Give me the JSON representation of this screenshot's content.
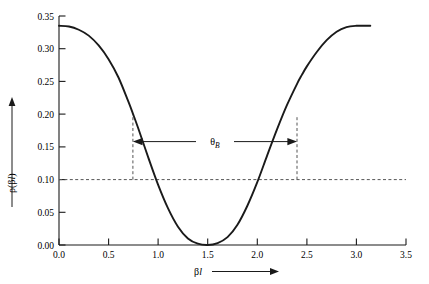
{
  "chart_data": {
    "type": "line",
    "title": "",
    "xlabel": "βl",
    "ylabel": "ρ(βl)",
    "xlim": [
      0.0,
      3.5
    ],
    "ylim": [
      0.0,
      0.35
    ],
    "grid": false,
    "legend": "none",
    "x_ticks": [
      "0.0",
      "0.5",
      "1.0",
      "1.5",
      "2.0",
      "2.5",
      "3.0",
      "3.5"
    ],
    "x_tick_values": [
      0.0,
      0.5,
      1.0,
      1.5,
      2.0,
      2.5,
      3.0,
      3.5
    ],
    "y_ticks": [
      "0.00",
      "0.05",
      "0.10",
      "0.15",
      "0.20",
      "0.25",
      "0.30",
      "0.35"
    ],
    "y_tick_values": [
      0.0,
      0.05,
      0.1,
      0.15,
      0.2,
      0.25,
      0.3,
      0.35
    ],
    "series": [
      {
        "name": "ρ(βl)",
        "x": [
          0.0,
          0.1,
          0.2,
          0.3,
          0.4,
          0.5,
          0.6,
          0.7,
          0.75,
          0.8,
          0.9,
          1.0,
          1.1,
          1.2,
          1.3,
          1.4,
          1.5,
          1.6,
          1.7,
          1.8,
          1.9,
          2.0,
          2.1,
          2.2,
          2.3,
          2.4,
          2.45,
          2.5,
          2.6,
          2.7,
          2.8,
          2.9,
          3.0,
          3.1,
          3.14
        ],
        "values": [
          0.335,
          0.334,
          0.329,
          0.32,
          0.305,
          0.284,
          0.256,
          0.219,
          0.199,
          0.178,
          0.134,
          0.092,
          0.056,
          0.028,
          0.01,
          0.002,
          0.0,
          0.003,
          0.012,
          0.031,
          0.06,
          0.096,
          0.137,
          0.177,
          0.214,
          0.246,
          0.26,
          0.273,
          0.295,
          0.313,
          0.326,
          0.333,
          0.335,
          0.335,
          0.335
        ]
      }
    ],
    "annotations": [
      {
        "name": "threshold-line",
        "type": "hline",
        "y": 0.1,
        "style": "dashed",
        "label": ""
      },
      {
        "name": "left-bandwidth-marker",
        "type": "vline",
        "x": 0.745,
        "y_from": 0.1,
        "y_to": 0.195,
        "style": "dashed"
      },
      {
        "name": "right-bandwidth-marker",
        "type": "vline",
        "x": 2.4,
        "y_from": 0.1,
        "y_to": 0.195,
        "style": "dashed"
      },
      {
        "name": "bandwidth-arrow",
        "type": "double-arrow",
        "x_from": 0.745,
        "x_to": 2.4,
        "y": 0.158,
        "label": "θ",
        "label_sub": "B"
      }
    ]
  },
  "axes": {
    "x_axis_label": "β",
    "x_axis_label_italic": "l",
    "y_axis_label_rho": "ρ(β",
    "y_axis_label_italic": "l",
    "y_axis_label_close": ")",
    "x_arrow": "right-arrow",
    "y_arrow": "up-arrow"
  },
  "colors": {
    "curve": "#1a1a1a",
    "axis": "#1a1a1a",
    "dashed": "#555555",
    "background": "#ffffff"
  }
}
